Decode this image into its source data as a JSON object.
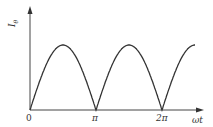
{
  "chart_data": {
    "type": "line",
    "title": "",
    "xlabel": "ωt",
    "ylabel": "I_θ",
    "x_ticks": [
      "0",
      "π",
      "2π"
    ],
    "series": [
      {
        "name": "I_θ",
        "x": [
          0,
          0.25,
          0.5,
          0.75,
          1.0,
          1.25,
          1.5,
          1.75,
          2.0,
          2.25,
          2.5
        ],
        "x_unit": "π",
        "values": [
          0,
          0.707,
          1,
          0.707,
          0,
          0.707,
          1,
          0.707,
          0,
          0.707,
          1
        ]
      }
    ]
  },
  "labels": {
    "ylabel_main": "I",
    "ylabel_sub": "θ",
    "xlabel": "ωt",
    "origin": "0",
    "pi": "π",
    "two_pi": "2π"
  },
  "colors": {
    "line": "#333333",
    "axis": "#444444"
  }
}
